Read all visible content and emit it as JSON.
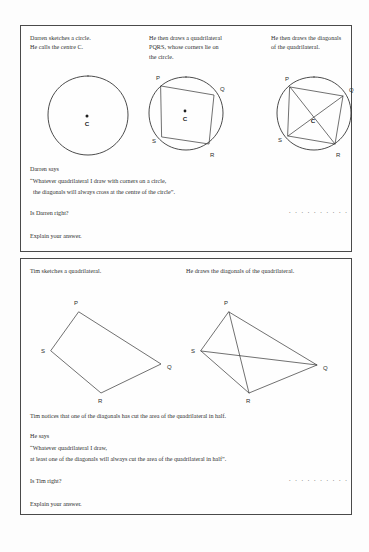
{
  "document": {
    "type": "maths-worksheet-scan",
    "background_color": "#fdfdfd",
    "ink_color": "#2c2c2c"
  },
  "question_darren": {
    "columns": [
      {
        "lines": [
          "Darren sketches a circle.",
          "He calls the centre C."
        ]
      },
      {
        "lines": [
          "He then draws a quadrilateral",
          "PQRS, whose corners lie on",
          "the circle."
        ]
      },
      {
        "lines": [
          "He then draws the diagonals",
          "of the quadrilateral."
        ]
      }
    ],
    "says_heading": "Darren says",
    "quote_line_1": "“Whatever quadrilateral I draw with corners on a circle,",
    "quote_line_2": "the diagonals will always cross at the centre of the circle”.",
    "ask": "Is Darren right?",
    "answer_dots": ". . . . . . . . . .",
    "explain": "Explain your answer."
  },
  "question_tim": {
    "columns": [
      {
        "lines": [
          "Tim sketches a quadrilateral."
        ]
      },
      {
        "lines": [
          "He draws the diagonals of the quadrilateral."
        ]
      }
    ],
    "notice": "Tim notices that one of the diagonals has cut the area of the quadrilateral in half.",
    "says_heading": "He says",
    "quote_line_1": "“Whatever quadrilateral I draw,",
    "quote_line_2": "at least one of the diagonals will always cut the area of the quadrilateral in half”.",
    "ask": "Is Tim right?",
    "answer_dots": ". . . . . . . . . .",
    "explain": "Explain your answer."
  },
  "figures": {
    "circle_plain": {
      "name": "circle with centre C",
      "centre_label": "C"
    },
    "circle_quad": {
      "name": "cyclic quadrilateral PQRS",
      "centre_label": "C",
      "vertices": [
        "P",
        "Q",
        "R",
        "S"
      ]
    },
    "circle_quad_diagonals": {
      "name": "cyclic quadrilateral PQRS with diagonals",
      "centre_label": "C",
      "vertices": [
        "P",
        "Q",
        "R",
        "S"
      ]
    },
    "quad_plain": {
      "name": "quadrilateral PQRS",
      "vertices": [
        "P",
        "Q",
        "R",
        "S"
      ]
    },
    "quad_diagonals": {
      "name": "quadrilateral PQRS with diagonals",
      "vertices": [
        "P",
        "Q",
        "R",
        "S"
      ]
    }
  }
}
